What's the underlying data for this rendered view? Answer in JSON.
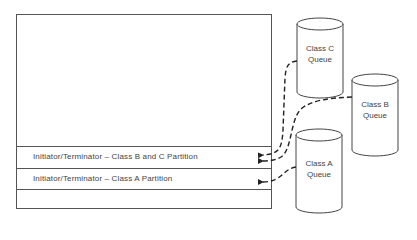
{
  "diagram": {
    "partitions": [
      {
        "label": "Initiator/Terminator – Class B and C Partition"
      },
      {
        "label": "Initiator/Terminator – Class A Partition"
      }
    ],
    "queues": [
      {
        "id": "c",
        "line1": "Class C",
        "line2": "Queue"
      },
      {
        "id": "b",
        "line1": "Class B",
        "line2": "Queue"
      },
      {
        "id": "a",
        "line1": "Class A",
        "line2": "Queue"
      }
    ],
    "connections": [
      {
        "from": "Class C Queue",
        "to": "Initiator/Terminator – Class B and C Partition",
        "style": "dashed-arrow"
      },
      {
        "from": "Class B Queue",
        "to": "Initiator/Terminator – Class B and C Partition",
        "style": "dashed-arrow"
      },
      {
        "from": "Class A Queue",
        "to": "Initiator/Terminator – Class A Partition",
        "style": "dashed-arrow"
      }
    ]
  }
}
